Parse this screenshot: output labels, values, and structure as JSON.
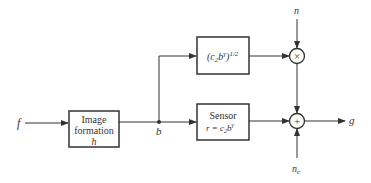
{
  "diagram": {
    "input_label": "f",
    "output_label": "g",
    "junction_label": "b",
    "blocks": [
      {
        "id": "image-formation",
        "lines": [
          "Image",
          "formation",
          "h"
        ]
      },
      {
        "id": "sqrt-gain",
        "lines": [
          "(c",
          "2",
          "b",
          "γ",
          ")",
          "1/2"
        ]
      },
      {
        "id": "sensor",
        "lines": [
          "Sensor",
          "r = c",
          "2",
          "b",
          "γ"
        ]
      }
    ],
    "multiplier": {
      "symbol": "×",
      "noise_label": "n"
    },
    "adder": {
      "symbol": "+",
      "noise_label": "n",
      "noise_subscript": "c"
    },
    "colors": {
      "stroke": "#333333",
      "background": "#ffffff"
    }
  }
}
